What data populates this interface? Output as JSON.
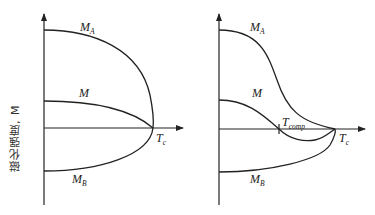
{
  "y_axis_label": "磁化强度, M",
  "panels": [
    {
      "id": "left",
      "description": "Ferrimagnet without compensation point",
      "curves": [
        {
          "name": "MA",
          "label_main": "M",
          "label_sub": "A"
        },
        {
          "name": "M",
          "label_main": "M",
          "label_sub": ""
        },
        {
          "name": "MB",
          "label_main": "M",
          "label_sub": "B"
        }
      ],
      "x_marks": [
        {
          "label_main": "T",
          "label_sub": "c"
        }
      ]
    },
    {
      "id": "right",
      "description": "Ferrimagnet with compensation temperature",
      "curves": [
        {
          "name": "MA",
          "label_main": "M",
          "label_sub": "A"
        },
        {
          "name": "M",
          "label_main": "M",
          "label_sub": ""
        },
        {
          "name": "MB",
          "label_main": "M",
          "label_sub": "B"
        }
      ],
      "x_marks": [
        {
          "label_main": "T",
          "label_sub": "comp"
        },
        {
          "label_main": "T",
          "label_sub": "c"
        }
      ]
    }
  ],
  "colors": {
    "line": "#222222",
    "background": "#ffffff"
  }
}
